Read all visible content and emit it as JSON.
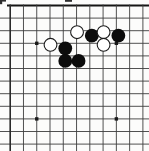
{
  "diagram": {
    "kind": "go-board-scan",
    "visible_grid": {
      "cols": 11,
      "rows": 12,
      "thick_edges": [
        "top"
      ]
    },
    "star_points": [
      {
        "col": 3,
        "row": 4
      },
      {
        "col": 9,
        "row": 4
      },
      {
        "col": 3,
        "row": 10
      },
      {
        "col": 9,
        "row": 10
      }
    ],
    "stones": {
      "white": [
        {
          "col": 6,
          "row": 3
        },
        {
          "col": 8,
          "row": 3
        },
        {
          "col": 8,
          "row": 4
        },
        {
          "col": 4,
          "row": 4
        }
      ],
      "black": [
        {
          "col": 7,
          "row": 3
        },
        {
          "col": 9,
          "row": 3
        },
        {
          "col": 5,
          "row": 4
        },
        {
          "col": 5,
          "row": 5
        },
        {
          "col": 6,
          "row": 5
        }
      ]
    },
    "counts": {
      "white_stones": 4,
      "black_stones": 5
    },
    "colors": {
      "paper": "#fcfcfb",
      "grid_line": "#3d3d3d",
      "edge_line": "#151515",
      "left_line": "#2a2a2a",
      "black_stone": "#0c0c0c",
      "white_stone": "#ffffff",
      "white_stone_rim": "#1c1c1c",
      "star_point": "#1a1a1a"
    },
    "scan_marks": [
      {
        "x": 0,
        "y": 0,
        "w": 2.2,
        "h": 4.2
      },
      {
        "x": 0,
        "y": 0,
        "w": 6.0,
        "h": 1.6
      },
      {
        "x": 65,
        "y": 0,
        "w": 7.0,
        "h": 1.8
      }
    ]
  }
}
